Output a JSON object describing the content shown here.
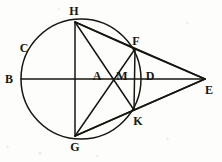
{
  "figure": {
    "stroke_color": "#17160f",
    "background_color": "#fdfdfc",
    "stroke_width": 1.5
  },
  "circle": {
    "name": "main-circle",
    "cx": 81,
    "cy": 79,
    "r": 60
  },
  "points": [
    {
      "id": "B",
      "label": "B",
      "x": 21,
      "y": 79,
      "label_x": 9,
      "label_y": 79
    },
    {
      "id": "C",
      "label": "C",
      "x": 31,
      "y": 53,
      "label_x": 24,
      "label_y": 48
    },
    {
      "id": "H",
      "label": "H",
      "x": 75,
      "y": 22,
      "label_x": 74,
      "label_y": 11
    },
    {
      "id": "F",
      "label": "F",
      "x": 135,
      "y": 49,
      "label_x": 136,
      "label_y": 41
    },
    {
      "id": "A",
      "label": "A",
      "x": 108,
      "y": 80,
      "label_x": 97,
      "label_y": 76
    },
    {
      "id": "M",
      "label": "M",
      "x": 124,
      "y": 80,
      "label_x": 122,
      "label_y": 76
    },
    {
      "id": "D",
      "label": "D",
      "x": 141,
      "y": 79,
      "label_x": 150,
      "label_y": 76
    },
    {
      "id": "E",
      "label": "E",
      "x": 205,
      "y": 79,
      "label_x": 209,
      "label_y": 90
    },
    {
      "id": "K",
      "label": "K",
      "x": 134,
      "y": 110,
      "label_x": 138,
      "label_y": 121
    },
    {
      "id": "G",
      "label": "G",
      "x": 75,
      "y": 136,
      "label_x": 75,
      "label_y": 147
    }
  ],
  "segments": [
    {
      "name": "segment-BE-diameter-axis",
      "from": "B",
      "to": "E"
    },
    {
      "name": "segment-HG-vertical-chord",
      "from": "H",
      "to": "G"
    },
    {
      "name": "segment-HF-chord",
      "from": "H",
      "to": "F"
    },
    {
      "name": "segment-HK-chord",
      "from": "H",
      "to": "K"
    },
    {
      "name": "segment-GF-chord",
      "from": "G",
      "to": "F"
    },
    {
      "name": "segment-GK-chord",
      "from": "G",
      "to": "K"
    },
    {
      "name": "segment-FK-vertical-chord",
      "from": "F",
      "to": "K"
    },
    {
      "name": "segment-FE-tangent-line",
      "from": "F",
      "to": "E"
    },
    {
      "name": "segment-KE-tangent-line",
      "from": "K",
      "to": "E"
    },
    {
      "name": "segment-HE-line",
      "from": "H",
      "to": "E"
    },
    {
      "name": "segment-GE-line",
      "from": "G",
      "to": "E"
    }
  ]
}
